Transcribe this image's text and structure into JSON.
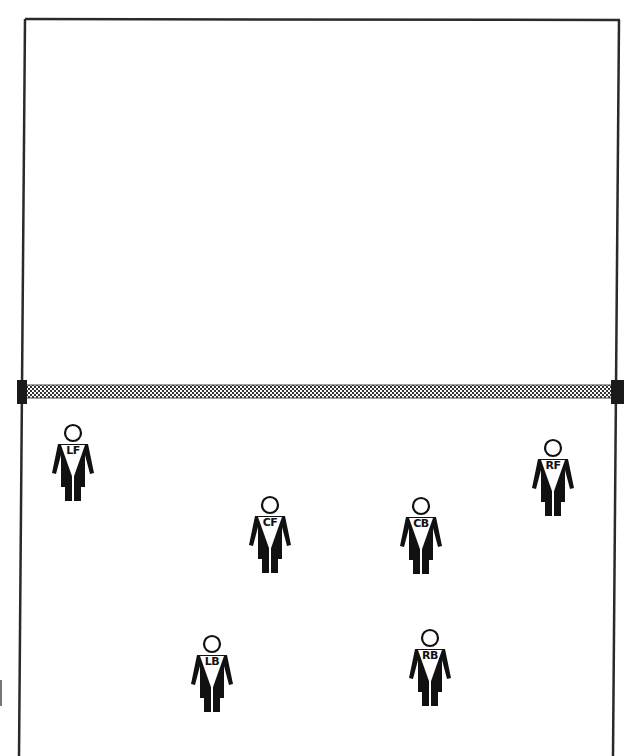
{
  "diagram": {
    "type": "volleyball-court-rotation",
    "colors": {
      "line": "#2a2a2a",
      "player": "#111111",
      "net": "#555555",
      "background": "#ffffff"
    },
    "court": {
      "top_left": [
        25,
        19
      ],
      "top_right": [
        619,
        20
      ],
      "bottom_left": [
        19,
        756
      ],
      "bottom_right": [
        613,
        756
      ],
      "net_y": 391
    },
    "players": [
      {
        "label": "LF",
        "x": 50,
        "y": 423
      },
      {
        "label": "RF",
        "x": 530,
        "y": 438
      },
      {
        "label": "CF",
        "x": 247,
        "y": 495
      },
      {
        "label": "CB",
        "x": 398,
        "y": 496
      },
      {
        "label": "LB",
        "x": 189,
        "y": 634
      },
      {
        "label": "RB",
        "x": 407,
        "y": 628
      }
    ]
  }
}
